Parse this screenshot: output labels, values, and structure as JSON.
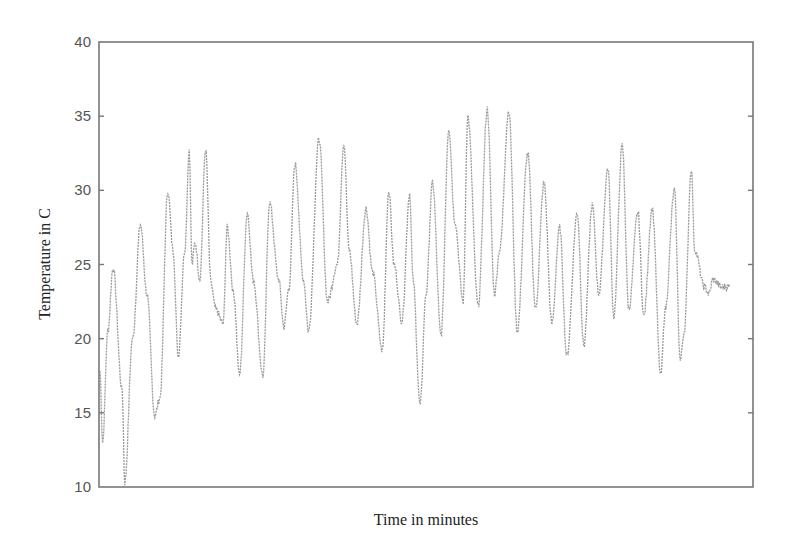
{
  "chart_data": {
    "type": "line",
    "title": "",
    "xlabel": "Time in minutes",
    "ylabel": "Temperature in C",
    "ylim": [
      10,
      40
    ],
    "yticks": [
      10,
      15,
      20,
      25,
      30,
      35,
      40
    ],
    "xticks": [],
    "grid": false,
    "legend": null,
    "series": [
      {
        "name": "Temperature",
        "color": "#9a9a9a",
        "points_note": "x is relative position across plot (0-1), y is temperature in C; peaks/troughs of an oscillating daily temperature trace",
        "x": [
          0.0,
          0.004,
          0.012,
          0.02,
          0.034,
          0.038,
          0.05,
          0.062,
          0.072,
          0.084,
          0.092,
          0.104,
          0.112,
          0.12,
          0.13,
          0.137,
          0.141,
          0.146,
          0.153,
          0.162,
          0.17,
          0.177,
          0.189,
          0.195,
          0.205,
          0.214,
          0.226,
          0.235,
          0.25,
          0.26,
          0.274,
          0.282,
          0.29,
          0.299,
          0.312,
          0.32,
          0.336,
          0.349,
          0.364,
          0.374,
          0.382,
          0.394,
          0.408,
          0.418,
          0.433,
          0.443,
          0.451,
          0.463,
          0.475,
          0.48,
          0.491,
          0.5,
          0.51,
          0.523,
          0.535,
          0.544,
          0.557,
          0.564,
          0.58,
          0.594,
          0.605,
          0.613,
          0.627,
          0.64,
          0.656,
          0.668,
          0.681,
          0.693,
          0.705,
          0.716,
          0.732,
          0.742,
          0.755,
          0.765,
          0.779,
          0.788,
          0.801,
          0.811,
          0.825,
          0.834,
          0.847,
          0.86,
          0.867,
          0.881,
          0.89,
          0.896,
          0.907,
          0.912,
          0.927,
          0.934,
          0.94,
          0.953,
          0.958,
          0.966
        ],
        "y": [
          17.8,
          13.0,
          20.5,
          24.8,
          16.5,
          10.3,
          20.0,
          27.7,
          23.0,
          14.8,
          16.0,
          30.0,
          26.0,
          18.8,
          26.0,
          32.8,
          25.0,
          26.5,
          24.0,
          32.8,
          23.8,
          22.0,
          21.0,
          27.5,
          23.0,
          17.5,
          28.5,
          24.0,
          17.5,
          29.2,
          24.0,
          20.8,
          23.5,
          31.8,
          24.0,
          20.5,
          33.5,
          22.5,
          25.0,
          33.2,
          26.0,
          21.0,
          28.8,
          24.5,
          19.2,
          30.0,
          25.0,
          21.2,
          29.8,
          24.0,
          15.5,
          23.0,
          30.5,
          20.2,
          34.2,
          28.0,
          22.5,
          35.0,
          22.2,
          35.5,
          23.0,
          26.0,
          35.4,
          20.5,
          32.5,
          22.0,
          30.5,
          21.0,
          27.5,
          18.8,
          28.5,
          19.5,
          29.0,
          23.0,
          31.5,
          21.5,
          33.0,
          22.0,
          28.5,
          21.5,
          28.8,
          17.5,
          22.0,
          30.0,
          18.5,
          20.5,
          31.5,
          26.0,
          23.5,
          23.0,
          24.0,
          23.5,
          23.5,
          23.5
        ]
      }
    ]
  },
  "axes": {
    "x_title": "Time in minutes",
    "y_title": "Temperature in C",
    "y_tick_labels": [
      "10",
      "15",
      "20",
      "25",
      "30",
      "35",
      "40"
    ]
  }
}
